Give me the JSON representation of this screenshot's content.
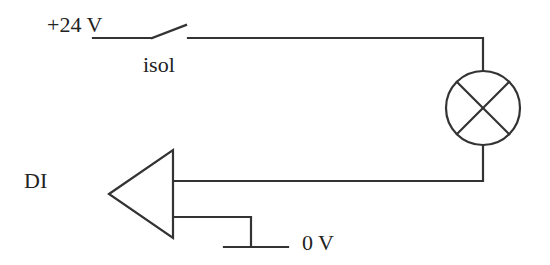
{
  "diagram": {
    "type": "circuit",
    "labels": {
      "supply": "+24 V",
      "switch": "isol",
      "input": "DI",
      "ground": "0 V"
    },
    "components": [
      {
        "id": "supply",
        "label": "+24 V",
        "kind": "voltage-source-terminal"
      },
      {
        "id": "switch",
        "label": "isol",
        "kind": "open-switch"
      },
      {
        "id": "lamp",
        "label": "",
        "kind": "lamp"
      },
      {
        "id": "di",
        "label": "DI",
        "kind": "digital-input-buffer"
      },
      {
        "id": "ground",
        "label": "0 V",
        "kind": "ground-reference"
      }
    ],
    "connections": [
      [
        "supply",
        "switch"
      ],
      [
        "switch",
        "lamp"
      ],
      [
        "lamp",
        "di"
      ],
      [
        "di",
        "ground"
      ]
    ],
    "colors": {
      "stroke": "#333333",
      "background": "#ffffff"
    }
  }
}
